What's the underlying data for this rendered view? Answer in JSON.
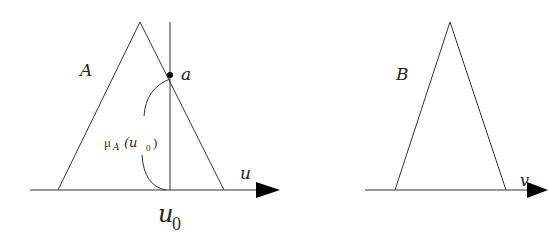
{
  "figure": {
    "left_panel": {
      "set_label": "A",
      "point_label": "a",
      "axis_label": "u",
      "x0_label_main": "u",
      "x0_label_sub": "0",
      "membership_label_mu": "μ",
      "membership_label_sub": "A",
      "membership_label_arg": "(u",
      "membership_label_argsub": "0",
      "membership_label_close": ")"
    },
    "right_panel": {
      "set_label": "B",
      "axis_label": "v"
    },
    "colors": {
      "line": "#333333",
      "background": "#ffffff"
    }
  }
}
